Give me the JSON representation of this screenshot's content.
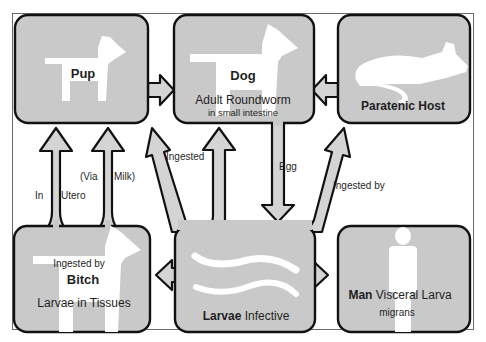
{
  "diagram": {
    "colors": {
      "box_fill": "#c9c9c9",
      "arrow_fill": "#d4d4d4",
      "outline": "#111111",
      "silhouette": "#ffffff",
      "frame": "#555555"
    },
    "nodes": {
      "pup": {
        "title": "Pup",
        "icon": "dog-icon"
      },
      "dog": {
        "title": "Dog",
        "subtitle": "Adult Roundworm",
        "detail": "in small intestine",
        "icon": "dog-icon"
      },
      "paratenic": {
        "title": "Paratenic Host",
        "icon": "rodent-icon"
      },
      "bitch": {
        "pretitle": "Ingested by",
        "title": "Bitch",
        "subtitle": "Larvae in Tissues",
        "icon": "dog-icon"
      },
      "larvae": {
        "title_bold": "Larvae",
        "title_rest": "Infective",
        "icon": "worm-icon"
      },
      "man": {
        "title_bold": "Man",
        "title_rest": "Visceral Larva",
        "detail": "migrans",
        "icon": "human-icon"
      }
    },
    "edge_labels": {
      "in": "In",
      "utero": "Utero",
      "via": "(Via",
      "milk": "Milk)",
      "ingested": "Ingested",
      "egg": "Egg",
      "ingested_by": "Ingested by"
    },
    "edges": [
      {
        "from": "pup",
        "to": "dog"
      },
      {
        "from": "paratenic",
        "to": "dog"
      },
      {
        "from": "dog",
        "to": "larvae",
        "label": "Egg"
      },
      {
        "from": "larvae",
        "to": "dog",
        "label": "Ingested"
      },
      {
        "from": "larvae",
        "to": "pup"
      },
      {
        "from": "larvae",
        "to": "paratenic",
        "label": "Ingested by"
      },
      {
        "from": "larvae",
        "to": "bitch"
      },
      {
        "from": "larvae",
        "to": "man"
      },
      {
        "from": "bitch",
        "to": "pup",
        "label": "In Utero"
      },
      {
        "from": "bitch",
        "to": "pup",
        "label": "(Via Milk)"
      }
    ]
  }
}
